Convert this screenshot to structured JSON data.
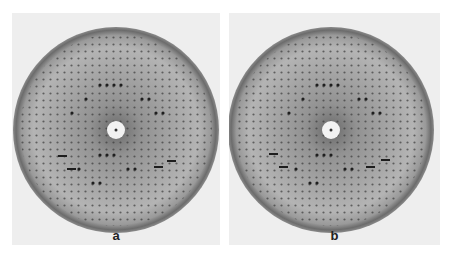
{
  "figure": {
    "panels": [
      {
        "label": "a",
        "left": 12,
        "beam_stop_center": [
          104,
          117
        ]
      },
      {
        "label": "b",
        "left": 229,
        "beam_stop_center": [
          102,
          117
        ]
      }
    ],
    "colors": {
      "background": "#eeeeee",
      "ring": "#6f6f6f",
      "interior": "#a8a8a8",
      "spot": "#1e1e1e",
      "beam_stop": "#f2f2f2"
    }
  }
}
